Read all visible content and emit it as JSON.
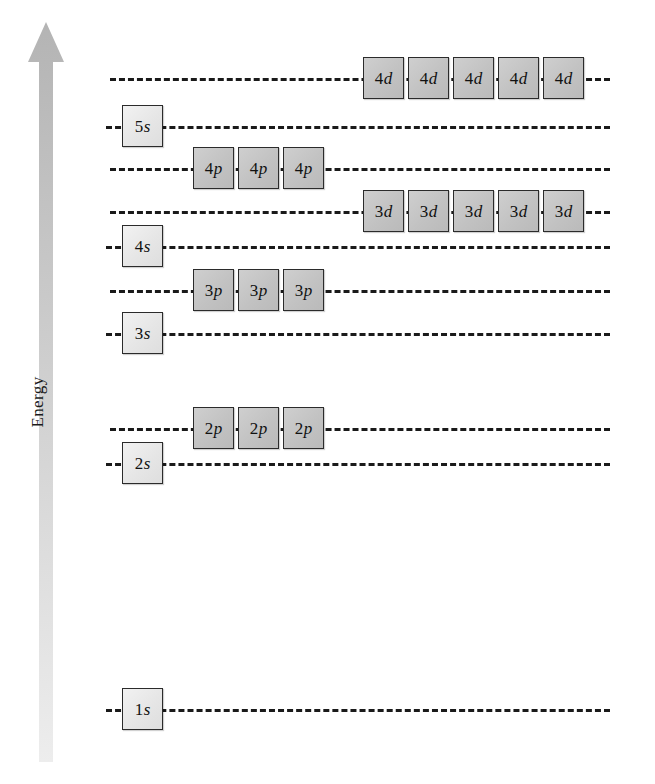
{
  "figure": {
    "type": "orbital-energy-level-diagram",
    "axis_label": "Energy",
    "axis_direction": "increasing upward",
    "background_color": "#ffffff",
    "line_color": "#1a1a1a",
    "s_box_color": "#e6e6e6",
    "pd_box_color": "#c2c2c2",
    "arrow_color": "#bfbfbf"
  },
  "levels": [
    {
      "id": "4d",
      "n": "4",
      "l": "d",
      "label": "4d",
      "box_count": 5,
      "box_type": "d-type",
      "y": 78,
      "box_start_x": 363,
      "line_start_x": 110,
      "line_end_x": 610
    },
    {
      "id": "5s",
      "n": "5",
      "l": "s",
      "label": "5s",
      "box_count": 1,
      "box_type": "s-type",
      "y": 126,
      "box_start_x": 122,
      "line_start_x": 106,
      "line_end_x": 610
    },
    {
      "id": "4p",
      "n": "4",
      "l": "p",
      "label": "4p",
      "box_count": 3,
      "box_type": "p-type",
      "y": 168,
      "box_start_x": 193,
      "line_start_x": 110,
      "line_end_x": 610
    },
    {
      "id": "3d",
      "n": "3",
      "l": "d",
      "label": "3d",
      "box_count": 5,
      "box_type": "d-type",
      "y": 211,
      "box_start_x": 363,
      "line_start_x": 110,
      "line_end_x": 610
    },
    {
      "id": "4s",
      "n": "4",
      "l": "s",
      "label": "4s",
      "box_count": 1,
      "box_type": "s-type",
      "y": 246,
      "box_start_x": 122,
      "line_start_x": 106,
      "line_end_x": 610
    },
    {
      "id": "3p",
      "n": "3",
      "l": "p",
      "label": "3p",
      "box_count": 3,
      "box_type": "p-type",
      "y": 290,
      "box_start_x": 193,
      "line_start_x": 110,
      "line_end_x": 610
    },
    {
      "id": "3s",
      "n": "3",
      "l": "s",
      "label": "3s",
      "box_count": 1,
      "box_type": "s-type",
      "y": 333,
      "box_start_x": 122,
      "line_start_x": 106,
      "line_end_x": 610
    },
    {
      "id": "2p",
      "n": "2",
      "l": "p",
      "label": "2p",
      "box_count": 3,
      "box_type": "p-type",
      "y": 428,
      "box_start_x": 193,
      "line_start_x": 110,
      "line_end_x": 610
    },
    {
      "id": "2s",
      "n": "2",
      "l": "s",
      "label": "2s",
      "box_count": 1,
      "box_type": "s-type",
      "y": 463,
      "box_start_x": 122,
      "line_start_x": 106,
      "line_end_x": 610
    },
    {
      "id": "1s",
      "n": "1",
      "l": "s",
      "label": "1s",
      "box_count": 1,
      "box_type": "s-type",
      "y": 709,
      "box_start_x": 122,
      "line_start_x": 106,
      "line_end_x": 610
    }
  ]
}
